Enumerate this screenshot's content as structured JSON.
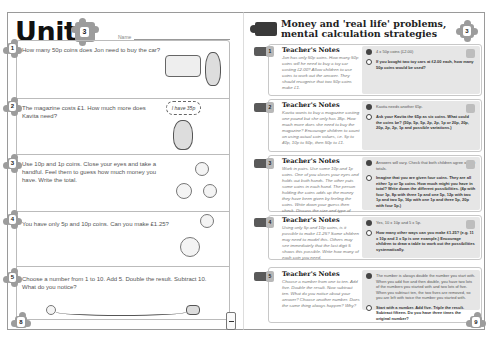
{
  "left_page": {
    "unit_label": "Unit",
    "unit_number": "3",
    "name_label": "Name",
    "page_number": "8",
    "questions": [
      {
        "number": "1",
        "text": "How many 50p coins does Jon need to buy the car?",
        "illustration": "toy-car-and-boy"
      },
      {
        "number": "2",
        "text": "The magazine costs £1. How much more does Kavita need?",
        "illustration": "girl-with-thought-bubble",
        "bubble_text": "I have 35p"
      },
      {
        "number": "3",
        "text": "Use 10p and 1p coins. Close your eyes and take a handful. Feel them to guess how much money you have. Write the total.",
        "illustration": "coins"
      },
      {
        "number": "4",
        "text": "You have only 5p and 10p coins. Can you make £1.25?",
        "illustration": "coins"
      },
      {
        "number": "5",
        "text": "Choose a number from 1 to 10. Add 5. Double the result. Subtract 10. What do you notice?",
        "illustration": "squiggle-path"
      }
    ]
  },
  "right_page": {
    "title_line1": "Money and 'real life' problems,",
    "title_line2": "mental calculation strategies",
    "unit_number": "3",
    "page_number": "9",
    "notes": [
      {
        "number": "1",
        "heading": "Teacher's Notes",
        "body": "Jon has only 50p coins. How many 50p coins will he need to buy a toy car costing £2.00? Allow children to use coins to work out the answer. They should recognise that two 50p coins make £1.",
        "answer": "4 x 50p coins (£2.00)",
        "extension": "If you bought two toy cars at £2.00 each, how many 50p coins would be used?"
      },
      {
        "number": "2",
        "heading": "Teacher's Notes",
        "body": "Kavita wants to buy a magazine costing one pound but she only has 35p. How much more does she need to buy the magazine? Encourage children to count on using actual coin values, i.e. 5p to 40p, 10p to 50p, then 50p to £1.",
        "answer": "Kavita needs another 65p.",
        "extension": "Ask your Kavita the 65p as six coins. What could the coins be? (50p, 5p, 5p, 2p, 2p, 1p or 20p, 20p, 20p, 2p, 2p, 1p and possible variations.)"
      },
      {
        "number": "3",
        "heading": "Teacher's Notes",
        "body": "Work in pairs. Use some 10p and 1p coins. One of you closes your eyes and holds out both hands. The other puts some coins in each hand. The person holding the coins adds up the money they have been given by feeling the coins. Write down your guess then check. Discuss the size and type of edges on the coins to help.",
        "answer": "Answers will vary. Check that both children agree on the totals.",
        "extension": "Imagine that you are given four coins. They are all either 1p or 5p coins. How much might you have in total? Write down the different possibilities. (4p with four 1p, 8p with three 1p and one 5p, 12p with two 1p and two 5p, 16p with one 1p and three 5p, 20p with four 5p.)"
      },
      {
        "number": "4",
        "heading": "Teacher's Notes",
        "body": "Using only 5p and 10p coins, is it possible to make £1.25? Some children may need to model this. Others may see immediately that the last digit 5 shows this possible. Write how many of each coin you need.",
        "answer": "Yes, 10 x 10p and 5 x 5p.",
        "extension": "How many other ways can you make £1.25? (e.g. 11 x 10p and 3 x 5p is one example.) Encourage children to draw a table to work out the possibilities systematically."
      },
      {
        "number": "5",
        "heading": "Teacher's Notes",
        "body": "Choose a number from one to ten. Add five. Double the result. Now subtract ten. What do you notice about your answer? Choose another number. Does the same thing always happen? Why?",
        "answer": "The number is always double the number you start with. When you add five and then double, you have two lots of the numbers you started with and two lots of five. When you subtract ten, the two fives are removed, so you are left with twice the number you started with.",
        "extension": "Start with a number. Add five. Triple the result. Subtract fifteen. Do you have three times the original number?"
      }
    ]
  }
}
